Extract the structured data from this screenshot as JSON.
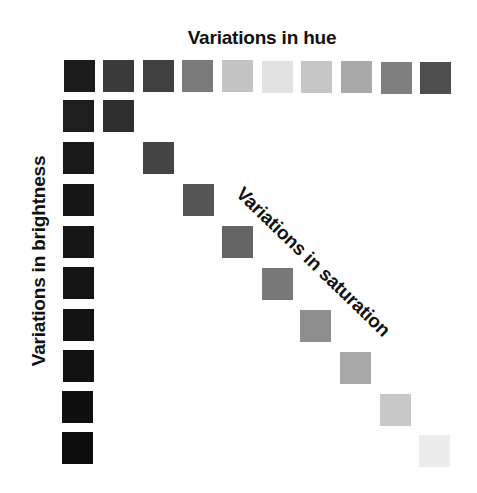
{
  "labels": {
    "hue": "Variations in hue",
    "brightness": "Variations in brightness",
    "saturation": "Variations in saturation"
  },
  "hue_row": [
    {
      "x": 64,
      "y": 60,
      "color": "#1c1c1c"
    },
    {
      "x": 103,
      "y": 60,
      "color": "#3a3a3a"
    },
    {
      "x": 143,
      "y": 60,
      "color": "#404040"
    },
    {
      "x": 182,
      "y": 60,
      "color": "#7a7a7a"
    },
    {
      "x": 222,
      "y": 60,
      "color": "#c4c4c4"
    },
    {
      "x": 262,
      "y": 61,
      "color": "#e2e2e2"
    },
    {
      "x": 301,
      "y": 61,
      "color": "#c6c6c6"
    },
    {
      "x": 341,
      "y": 61,
      "color": "#a9a9a9"
    },
    {
      "x": 381,
      "y": 62,
      "color": "#7f7f7f"
    },
    {
      "x": 420,
      "y": 62,
      "color": "#4e4e4e"
    }
  ],
  "brightness_column": [
    {
      "x": 63,
      "y": 100,
      "color": "#1e1e1e"
    },
    {
      "x": 63,
      "y": 142,
      "color": "#191919"
    },
    {
      "x": 63,
      "y": 184,
      "color": "#171717"
    },
    {
      "x": 63,
      "y": 226,
      "color": "#161616"
    },
    {
      "x": 63,
      "y": 267,
      "color": "#141414"
    },
    {
      "x": 63,
      "y": 309,
      "color": "#131313"
    },
    {
      "x": 63,
      "y": 350,
      "color": "#111111"
    },
    {
      "x": 62,
      "y": 391,
      "color": "#0f0f0f"
    },
    {
      "x": 62,
      "y": 432,
      "color": "#0d0d0d"
    }
  ],
  "saturation_diagonal": [
    {
      "x": 103,
      "y": 100,
      "color": "#2e2e2e"
    },
    {
      "x": 143,
      "y": 142,
      "color": "#444444"
    },
    {
      "x": 183,
      "y": 184,
      "color": "#555555"
    },
    {
      "x": 222,
      "y": 226,
      "color": "#656565"
    },
    {
      "x": 262,
      "y": 268,
      "color": "#787878"
    },
    {
      "x": 300,
      "y": 310,
      "color": "#8e8e8e"
    },
    {
      "x": 340,
      "y": 352,
      "color": "#a8a8a8"
    },
    {
      "x": 380,
      "y": 394,
      "color": "#c8c8c8"
    },
    {
      "x": 419,
      "y": 435,
      "color": "#ececec"
    }
  ]
}
